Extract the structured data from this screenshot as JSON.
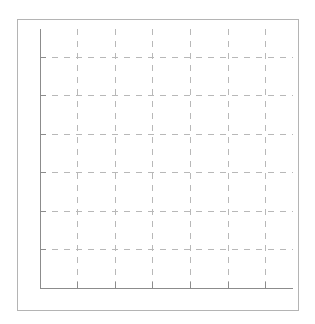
{
  "chart_data": {
    "type": "line",
    "title": "",
    "xlabel": "",
    "ylabel": "",
    "categories": [],
    "series": [],
    "x_ticks": 7,
    "y_ticks": 7,
    "grid": true,
    "grid_style": "dashed",
    "legend": null
  },
  "style": {
    "axis_color": "#8c8c8c",
    "grid_color": "#b8b8b8",
    "frame_color": "#b4b4b4"
  },
  "layout": {
    "x_axis_y": 288,
    "y_axis_x": 40,
    "plot_top": 29,
    "plot_right": 293,
    "v_grid_x": [
      77,
      115,
      152,
      190,
      228,
      265
    ],
    "h_grid_y": [
      57,
      95,
      134,
      172,
      211,
      249
    ]
  }
}
